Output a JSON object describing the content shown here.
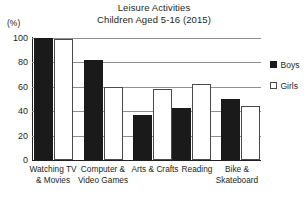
{
  "chart_data": {
    "type": "bar",
    "title": "Leisure Activities",
    "subtitle": "Children Aged 5-16  (2015)",
    "title_lines": [
      "Leisure Activities",
      "Children Aged 5-16  (2015)"
    ],
    "xlabel": "",
    "ylabel": "(%)",
    "ylim": [
      0,
      100
    ],
    "yticks": [
      0,
      20,
      40,
      60,
      80,
      100
    ],
    "ytick_labels": [
      "0",
      "20",
      "40",
      "60",
      "80",
      "100"
    ],
    "grid": true,
    "grid_axis": "y",
    "legend_position": "right",
    "categories": [
      "Watching TV & Movies",
      "Computer & Video Games",
      "Arts & Crafts",
      "Reading",
      "Bike & Skateboard"
    ],
    "category_lines": [
      [
        "Watching TV",
        "& Movies"
      ],
      [
        "Computer &",
        "Video Games"
      ],
      [
        "Arts & Crafts",
        ""
      ],
      [
        "Reading",
        ""
      ],
      [
        "Bike &",
        "Skateboard"
      ]
    ],
    "series": [
      {
        "name": "Boys",
        "color": "#1a1a1a",
        "values": [
          100,
          82,
          37,
          43,
          50
        ]
      },
      {
        "name": "Girls",
        "color": "#ffffff",
        "values": [
          99,
          60,
          58,
          62,
          44
        ]
      }
    ]
  },
  "legend": {
    "items": [
      {
        "label": "Boys",
        "marker": "filled-square-icon"
      },
      {
        "label": "Girls",
        "marker": "hollow-square-icon"
      }
    ]
  }
}
